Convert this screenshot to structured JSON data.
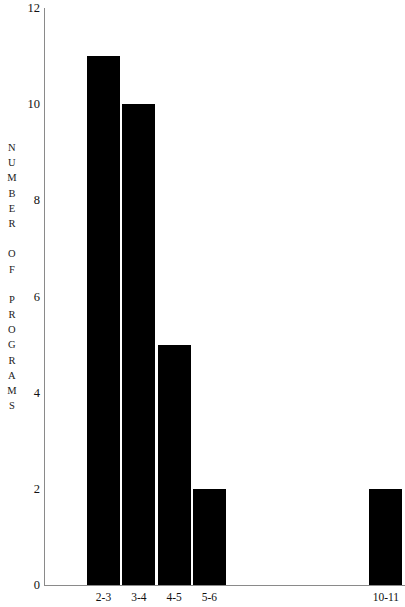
{
  "chart_data": {
    "type": "bar",
    "title": "",
    "subtitle": "",
    "xlabel": "",
    "ylabel": "NUMBER OF PROGRAMS",
    "categories": [
      "2-3",
      "3-4",
      "4-5",
      "5-6",
      "6-7",
      "7-8",
      "8-9",
      "9-10",
      "10-11"
    ],
    "values": [
      11,
      10,
      5,
      2,
      0,
      0,
      0,
      0,
      2
    ],
    "visible_tick_labels": [
      "2-3",
      "3-4",
      "4-5",
      "5-6",
      "10-11"
    ],
    "ylim": [
      0,
      12
    ],
    "ytick_labels": [
      "12",
      "10",
      "8",
      "6",
      "4",
      "2",
      "0"
    ],
    "ytick_values": [
      12,
      10,
      8,
      6,
      4,
      2,
      0
    ],
    "grid": false,
    "legend": null,
    "annotations": [],
    "bar_color": "#000000",
    "axis_color": "#8a8a8a",
    "background_color": "#ffffff"
  },
  "axis_title_letters": [
    "N",
    "U",
    "M",
    "B",
    "E",
    "R",
    "",
    "O",
    "F",
    "",
    "P",
    "R",
    "O",
    "G",
    "R",
    "A",
    "M",
    "S"
  ]
}
